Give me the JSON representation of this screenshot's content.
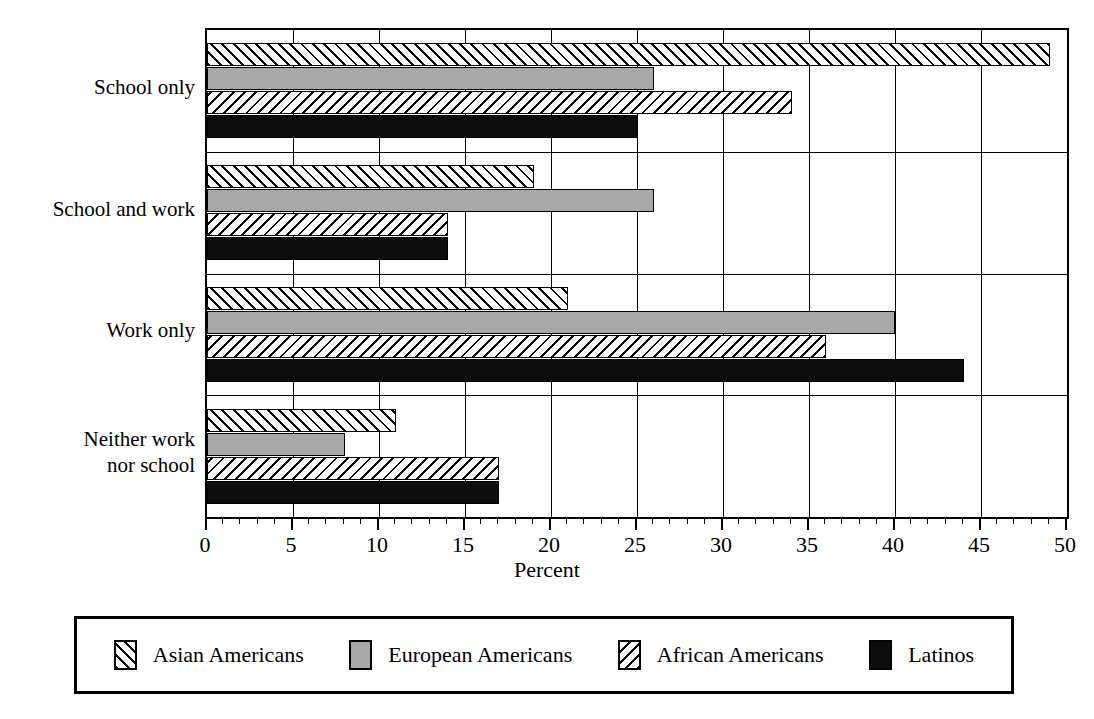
{
  "chart_data": {
    "type": "bar",
    "orientation": "horizontal",
    "title": "",
    "xlabel": "Percent",
    "ylabel": "",
    "xlim": [
      0,
      50
    ],
    "xticks": [
      0,
      5,
      10,
      15,
      20,
      25,
      30,
      35,
      40,
      45,
      50
    ],
    "xtick_labels": [
      "0",
      "5",
      "10",
      "15",
      "20",
      "25",
      "30",
      "35",
      "40",
      "45",
      "50"
    ],
    "minor_tick_step": 1,
    "grid": "vertical-major",
    "legend_position": "bottom",
    "categories": [
      "School only",
      "School and work",
      "Work only",
      "Neither work nor school"
    ],
    "category_labels": [
      [
        "School only"
      ],
      [
        "School and work"
      ],
      [
        "Work only"
      ],
      [
        "Neither work",
        "nor school"
      ]
    ],
    "series": [
      {
        "name": "Asian Americans",
        "fill": "forward-diagonal-hatch",
        "color": "#ffffff",
        "values": [
          49,
          19,
          21,
          11
        ]
      },
      {
        "name": "European Americans",
        "fill": "solid-gray",
        "color": "#a8a8a8",
        "values": [
          26,
          26,
          40,
          8
        ]
      },
      {
        "name": "African Americans",
        "fill": "backward-diagonal-hatch",
        "color": "#ffffff",
        "values": [
          34,
          14,
          36,
          17
        ]
      },
      {
        "name": "Latinos",
        "fill": "solid-black",
        "color": "#0d0d0d",
        "values": [
          25,
          14,
          44,
          17
        ]
      }
    ]
  },
  "legend": {
    "items": [
      {
        "label": "Asian Americans",
        "swatch": "forward-diagonal-hatch"
      },
      {
        "label": "European Americans",
        "swatch": "solid-gray"
      },
      {
        "label": "African Americans",
        "swatch": "backward-diagonal-hatch"
      },
      {
        "label": "Latinos",
        "swatch": "solid-black"
      }
    ]
  }
}
